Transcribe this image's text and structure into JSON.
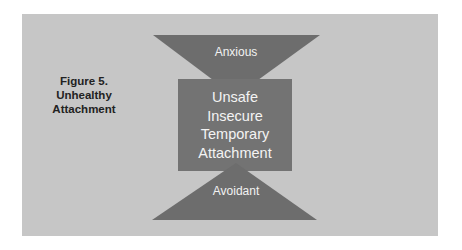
{
  "figure": {
    "caption": [
      "Figure 5.",
      "Unhealthy",
      "Attachment"
    ]
  },
  "diagram": {
    "top_shape": {
      "label": "Anxious"
    },
    "center_box": {
      "lines": [
        "Unsafe",
        "Insecure",
        "Temporary",
        "Attachment"
      ]
    },
    "bottom_shape": {
      "label": "Avoidant"
    }
  },
  "colors": {
    "page_background": "#ffffff",
    "panel": "#c6c6c6",
    "shapes": "#6d6d6d",
    "box": "#737373",
    "shape_text": "#f2f2f2",
    "caption_text": "#222222"
  }
}
